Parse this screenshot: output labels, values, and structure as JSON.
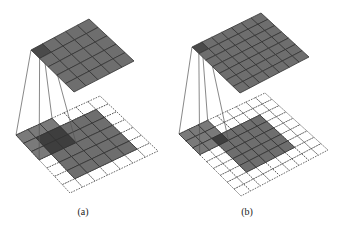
{
  "figure": {
    "colors": {
      "cell_fill": "#6e6e6e",
      "cell_stroke": "#333333",
      "highlight_fill": "#4a4a4a",
      "kernel_overlap_fill": "#3e3e3e",
      "dashed_stroke": "#444444",
      "line_color": "#555555"
    },
    "panels": [
      {
        "id": "a",
        "caption": "(a)",
        "caption_pos": [
          83,
          206
        ],
        "output_grid": {
          "rows": 5,
          "cols": 5,
          "corners": [
            [
              31,
              50
            ],
            [
              89,
              19
            ],
            [
              134,
              61
            ],
            [
              74,
              92
            ]
          ],
          "highlight": [
            0,
            0
          ]
        },
        "input_padded": {
          "rows": 7,
          "cols": 7,
          "corners": [
            [
              16,
              135
            ],
            [
              100,
              96
            ],
            [
              158,
              151
            ],
            [
              70,
              193
            ]
          ],
          "dashed": true
        },
        "input_inner": {
          "offset": 1,
          "size": 5
        },
        "kernel": {
          "row": 0,
          "col": 0,
          "size": 3
        }
      },
      {
        "id": "b",
        "caption": "(b)",
        "caption_pos": [
          247,
          206
        ],
        "output_grid": {
          "rows": 7,
          "cols": 7,
          "corners": [
            [
              192,
              47
            ],
            [
              261,
              13
            ],
            [
              309,
              57
            ],
            [
              240,
              93
            ]
          ],
          "highlight": [
            0,
            0
          ]
        },
        "input_padded": {
          "rows": 9,
          "cols": 9,
          "corners": [
            [
              179,
              134
            ],
            [
              265,
              93
            ],
            [
              328,
              150
            ],
            [
              241,
              196
            ]
          ],
          "dashed": true
        },
        "input_inner": {
          "offset": 2,
          "size": 5
        },
        "kernel": {
          "row": 0,
          "col": 0,
          "size": 3
        }
      }
    ]
  }
}
